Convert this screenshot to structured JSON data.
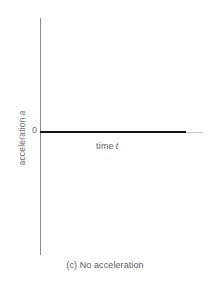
{
  "figure": {
    "caption": "(c) No acceleration",
    "background_color": "#ffffff"
  },
  "axes": {
    "origin_tick_label": "0",
    "y_title_text": "acceleration",
    "y_title_symbol": "a",
    "x_title_text": "time",
    "x_title_symbol": "t",
    "axis_color": "#8c8c8c",
    "axis_tail_color": "#c9c9c9"
  },
  "chart_data": {
    "type": "line",
    "title": "(c) No acceleration",
    "xlabel": "time t",
    "ylabel": "acceleration a",
    "xlim": [
      0,
      1
    ],
    "ylim": [
      -1,
      1
    ],
    "grid": false,
    "legend": null,
    "axis_tick_labels": {
      "y": [
        "0"
      ],
      "x": []
    },
    "series": [
      {
        "name": "acceleration",
        "color": "#151515",
        "line_width": 2,
        "x": [
          0,
          1
        ],
        "values": [
          0,
          0
        ],
        "description": "constant zero acceleration"
      }
    ]
  }
}
